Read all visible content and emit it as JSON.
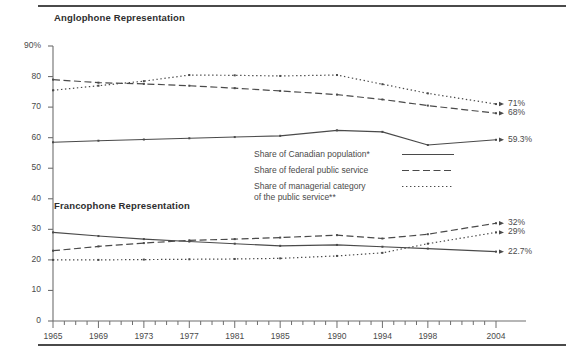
{
  "panels": {
    "anglophone_title": "Anglophone Representation",
    "francophone_title": "Francophone Representation"
  },
  "legend": {
    "items": [
      {
        "label": "Share of Canadian population*",
        "style": "solid"
      },
      {
        "label": "Share of federal public service",
        "style": "dashed"
      },
      {
        "label": "Share of managerial category\n of the public service**",
        "style": "dotted"
      }
    ]
  },
  "chart_data": {
    "type": "line",
    "title": "",
    "xlabel": "",
    "ylabel": "",
    "ylim": [
      0,
      90
    ],
    "yticks": [
      "0",
      "10",
      "20",
      "30",
      "40",
      "50",
      "60",
      "70",
      "80",
      "90%"
    ],
    "ytick_values": [
      0,
      10,
      20,
      30,
      40,
      50,
      60,
      70,
      80,
      90
    ],
    "xlim": [
      1965,
      2004
    ],
    "xticks": [
      "1965",
      "1969",
      "1973",
      "1977",
      "1981",
      "1985",
      "1990",
      "1994",
      "1998",
      "2004"
    ],
    "xtick_values": [
      1965,
      1969,
      1973,
      1977,
      1981,
      1985,
      1990,
      1994,
      1998,
      2004
    ],
    "minor_tick_interval": 1,
    "grid": false,
    "legend_position": "center",
    "x": [
      1965,
      1969,
      1973,
      1977,
      1981,
      1985,
      1990,
      1994,
      1998,
      2004
    ],
    "series": [
      {
        "name": "Anglophone - Share of Canadian population*",
        "group": "Anglophone Representation",
        "style": "solid",
        "values": [
          58.5,
          59.0,
          59.4,
          59.8,
          60.2,
          60.6,
          62.4,
          61.9,
          57.6,
          59.3
        ],
        "end_label": "59.3%"
      },
      {
        "name": "Anglophone - Share of federal public service",
        "group": "Anglophone Representation",
        "style": "dashed",
        "values": [
          79.0,
          78.0,
          77.6,
          77.0,
          76.2,
          75.3,
          74.1,
          72.5,
          70.5,
          68.0
        ],
        "end_label": "68%"
      },
      {
        "name": "Anglophone - Share of managerial category of the public service**",
        "group": "Anglophone Representation",
        "style": "dotted",
        "values": [
          75.5,
          77.0,
          78.5,
          80.5,
          80.4,
          80.2,
          80.5,
          77.5,
          74.5,
          71.0
        ],
        "end_label": "71%"
      },
      {
        "name": "Francophone - Share of Canadian population*",
        "group": "Francophone Representation",
        "style": "solid",
        "values": [
          29.0,
          27.8,
          26.8,
          26.0,
          25.3,
          24.6,
          24.9,
          24.3,
          23.7,
          22.7
        ],
        "end_label": "22.7%"
      },
      {
        "name": "Francophone - Share of federal public service",
        "group": "Francophone Representation",
        "style": "dashed",
        "values": [
          23.0,
          24.4,
          25.5,
          26.4,
          26.8,
          27.3,
          28.1,
          27.0,
          28.4,
          32.0
        ],
        "end_label": "32%"
      },
      {
        "name": "Francophone - Share of managerial category of the public service**",
        "group": "Francophone Representation",
        "style": "dotted",
        "values": [
          20.0,
          20.0,
          20.1,
          20.2,
          20.3,
          20.5,
          21.3,
          22.3,
          25.3,
          29.0
        ],
        "end_label": "29%"
      }
    ]
  }
}
